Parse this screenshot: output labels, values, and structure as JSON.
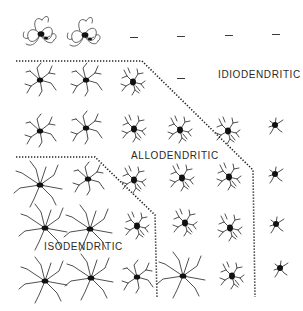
{
  "diagram": {
    "type": "neuron-dendritic-classification-grid",
    "regions": [
      {
        "id": "idiodendritic",
        "label": "IDIODENDRITIC"
      },
      {
        "id": "allodendritic",
        "label": "ALLODENDRITIC"
      },
      {
        "id": "isodendritic",
        "label": "ISODENDRITIC"
      }
    ],
    "grid": {
      "columns": 6,
      "rows": 6,
      "empty_marker": "–",
      "cells": [
        [
          "neuron-dense",
          "neuron-dense",
          "empty",
          "empty",
          "empty",
          "empty"
        ],
        [
          "neuron",
          "neuron",
          "neuron",
          "empty",
          "label-idio",
          "label-idio"
        ],
        [
          "neuron",
          "neuron",
          "neuron",
          "neuron",
          "neuron",
          "neuron-small"
        ],
        [
          "neuron-long",
          "neuron-long",
          "neuron",
          "neuron-bushy",
          "neuron-bushy",
          "neuron-small"
        ],
        [
          "neuron-long",
          "neuron-long",
          "neuron",
          "neuron-bushy",
          "neuron-bushy",
          "neuron-small"
        ],
        [
          "neuron-long",
          "neuron-long",
          "neuron",
          "neuron",
          "neuron-bushy",
          "neuron-small"
        ]
      ]
    },
    "colors": {
      "background": "#ffffff",
      "ink": "#1a1a1a",
      "dotted_line": "#222222"
    }
  }
}
